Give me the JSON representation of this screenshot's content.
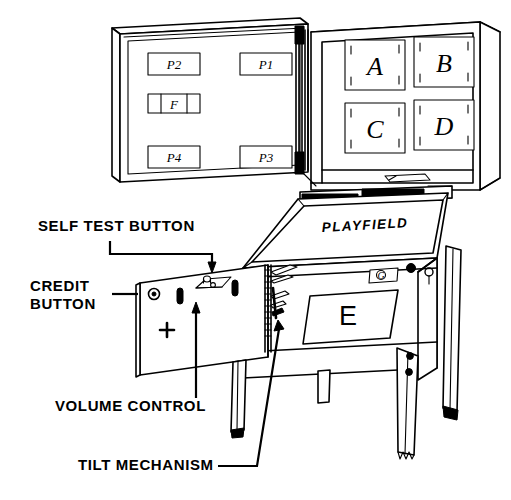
{
  "diagram": {
    "background_color": "#ffffff",
    "line_color": "#000000",
    "width": 511,
    "height": 500
  },
  "callouts": [
    {
      "id": "self-test-button",
      "label": "SELF TEST BUTTON",
      "x": 38,
      "y": 231
    },
    {
      "id": "credit-button-line1",
      "label": "CREDIT",
      "x": 30,
      "y": 291
    },
    {
      "id": "credit-button-line2",
      "label": "BUTTON",
      "x": 30,
      "y": 309
    },
    {
      "id": "volume-control",
      "label": "VOLUME CONTROL",
      "x": 55,
      "y": 411
    },
    {
      "id": "tilt-mechanism",
      "label": "TILT MECHANISM",
      "x": 78,
      "y": 470
    }
  ],
  "backbox": {
    "left_panel": {
      "name": "backbox-left-panel",
      "boards": [
        {
          "id": "p2",
          "label": "P2",
          "x": 148,
          "y": 53,
          "w": 52,
          "h": 22
        },
        {
          "id": "p1",
          "label": "P1",
          "x": 240,
          "y": 53,
          "w": 52,
          "h": 22
        },
        {
          "id": "p4",
          "label": "P4",
          "x": 148,
          "y": 146,
          "w": 52,
          "h": 22
        },
        {
          "id": "p3",
          "label": "P3",
          "x": 240,
          "y": 146,
          "w": 52,
          "h": 22
        }
      ],
      "fuse_block": {
        "id": "f",
        "label": "F",
        "x": 148,
        "y": 94,
        "w": 52,
        "h": 19,
        "segments": 3
      }
    },
    "right_panel": {
      "name": "backbox-right-panel",
      "modules": [
        {
          "id": "a",
          "label": "A",
          "x": 345,
          "y": 40,
          "w": 60,
          "h": 50
        },
        {
          "id": "b",
          "label": "B",
          "x": 414,
          "y": 40,
          "w": 60,
          "h": 50
        },
        {
          "id": "c",
          "label": "C",
          "x": 345,
          "y": 100,
          "w": 60,
          "h": 50
        },
        {
          "id": "d",
          "label": "D",
          "x": 414,
          "y": 100,
          "w": 60,
          "h": 50
        }
      ]
    }
  },
  "cabinet": {
    "playfield_label": "PLAYFIELD",
    "front_panel_label": "E",
    "badge_label": "G",
    "coin_door": {
      "name": "coin-door-open",
      "plus_mark": "+"
    }
  },
  "icon_names": {
    "self_test_button": "pushbutton-icon",
    "credit_button": "round-button-icon",
    "volume_control": "slider-knob-icon",
    "tilt_mechanism": "pendulum-icon",
    "connector_strip": "pin-header-icon",
    "leg_leveler": "leg-leveler-icon"
  }
}
